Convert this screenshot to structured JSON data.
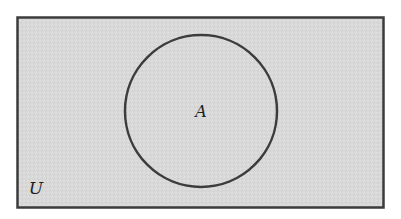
{
  "diagram": {
    "type": "venn",
    "universe": {
      "label": "U",
      "x": 17,
      "y": 17,
      "width": 367,
      "height": 191,
      "fill": "#d9d9d9",
      "stroke": "#3c3c3c"
    },
    "sets": [
      {
        "label": "A",
        "cx": 201,
        "cy": 111,
        "r": 76,
        "fill": "#dcdcdc",
        "stroke": "#3c3c3c"
      }
    ]
  }
}
